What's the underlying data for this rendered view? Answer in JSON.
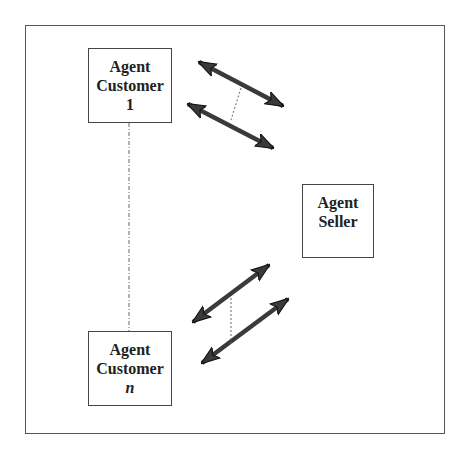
{
  "diagram": {
    "type": "multi-agent-negotiation",
    "nodes": [
      {
        "id": "customer1",
        "lines": [
          "Agent",
          "Customer",
          "1"
        ],
        "italic_last": false
      },
      {
        "id": "seller",
        "lines": [
          "Agent",
          "Seller"
        ],
        "italic_last": false
      },
      {
        "id": "customerN",
        "lines": [
          "Agent",
          "Customer",
          "n"
        ],
        "italic_last": true
      }
    ],
    "edges": [
      {
        "from": "customer1",
        "to": "seller",
        "style": "double-arrow",
        "count": 2,
        "grouped_by": "dashed-line"
      },
      {
        "from": "customerN",
        "to": "seller",
        "style": "double-arrow",
        "count": 2,
        "grouped_by": "dashed-line"
      },
      {
        "from": "customer1",
        "to": "customerN",
        "style": "dash-dot-line",
        "meaning": "ellipsis of customers"
      }
    ],
    "colors": {
      "frame": "#555555",
      "box_border": "#444444",
      "arrow_fill": "#3a3a3a",
      "arrow_stroke": "#111111",
      "dashed": "#666666",
      "text": "#222222"
    }
  }
}
